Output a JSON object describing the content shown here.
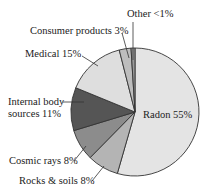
{
  "chart_data": {
    "type": "pie",
    "title": "",
    "slices": [
      {
        "name": "Radon",
        "value": 55,
        "label": "Radon 55%",
        "color": "#e4e4e4"
      },
      {
        "name": "Rocks & soils",
        "value": 8,
        "label": "Rocks & soils 8%",
        "color": "#b4b4b4"
      },
      {
        "name": "Cosmic rays",
        "value": 8,
        "label": "Cosmic rays 8%",
        "color": "#8c8c8c"
      },
      {
        "name": "Internal body sources",
        "value": 11,
        "label": "Internal body sources 11%",
        "color": "#555555"
      },
      {
        "name": "Medical",
        "value": 15,
        "label": "Medical 15%",
        "color": "#dedede"
      },
      {
        "name": "Consumer products",
        "value": 3,
        "label": "Consumer products 3%",
        "color": "#bdbdbd"
      },
      {
        "name": "Other",
        "value": 1,
        "label": "Other <1%",
        "color": "#9a9a9a"
      }
    ],
    "start_angle_deg": 0,
    "direction": "clockwise",
    "legend": "none (direct labels with leader lines)"
  },
  "labels": {
    "radon": "Radon 55%",
    "rocks": "Rocks & soils 8%",
    "cosmic": "Cosmic rays 8%",
    "internal_line1": "Internal body",
    "internal_line2": "sources 11%",
    "medical": "Medical 15%",
    "consumer": "Consumer products 3%",
    "other": "Other <1%"
  },
  "colors": {
    "outline": "#333333",
    "text": "#222222"
  }
}
